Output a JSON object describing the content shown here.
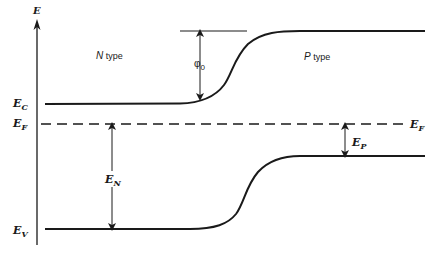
{
  "diagram": {
    "axis": {
      "label": "E"
    },
    "regions": [
      {
        "id": "n",
        "label_italic": "N",
        "label_rest": " type"
      },
      {
        "id": "p",
        "label_italic": "P",
        "label_rest": " type"
      }
    ],
    "levels": {
      "conduction": {
        "main": "E",
        "sub": "C"
      },
      "fermi_left": {
        "main": "E",
        "sub": "F"
      },
      "fermi_right": {
        "main": "E",
        "sub": "F"
      },
      "valence": {
        "main": "E",
        "sub": "V"
      }
    },
    "dimensions": {
      "phi0": {
        "main": "φ",
        "sub": "0"
      },
      "en": {
        "main": "E",
        "sub": "N"
      },
      "ep": {
        "main": "E",
        "sub": "P"
      }
    },
    "colors": {
      "ink": "#1a1a1a",
      "background": "#ffffff"
    }
  }
}
